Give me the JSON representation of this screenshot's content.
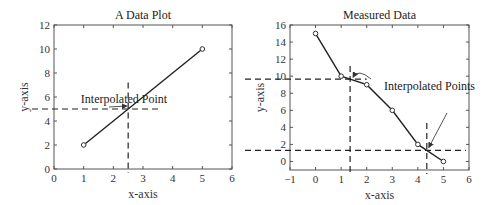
{
  "chart_data": [
    {
      "type": "line",
      "title": "A Data Plot",
      "xlabel": "x-axis",
      "ylabel": "y-axis",
      "xlim": [
        0,
        6
      ],
      "ylim": [
        0,
        12
      ],
      "xticks": [
        0,
        1,
        2,
        3,
        4,
        5,
        6
      ],
      "yticks": [
        0,
        2,
        4,
        6,
        8,
        10,
        12
      ],
      "grid": false,
      "series": [
        {
          "name": "data",
          "x": [
            1,
            5
          ],
          "y": [
            2,
            10
          ],
          "marker": "o"
        }
      ],
      "interpolated_points": [
        {
          "x": 2.5,
          "y": 5
        }
      ],
      "annotations": [
        {
          "text": "Interpolated Point",
          "target": [
            2.5,
            5
          ]
        }
      ]
    },
    {
      "type": "line",
      "title": "Measured Data",
      "xlabel": "x-axis",
      "ylabel": "y-axis",
      "xlim": [
        -1,
        6
      ],
      "ylim": [
        -1,
        16
      ],
      "xticks": [
        -1,
        0,
        1,
        2,
        3,
        4,
        5,
        6
      ],
      "yticks": [
        0,
        2,
        4,
        6,
        8,
        10,
        12,
        14,
        16
      ],
      "grid": false,
      "series": [
        {
          "name": "data",
          "x": [
            0,
            1,
            2,
            3,
            4,
            5
          ],
          "y": [
            15,
            10,
            9,
            6,
            2,
            0
          ],
          "marker": "o"
        }
      ],
      "interpolated_points": [
        {
          "x": 1.35,
          "y": 9.65
        },
        {
          "x": 4.35,
          "y": 1.3
        }
      ],
      "annotations": [
        {
          "text": "Interpolated Points",
          "targets": [
            [
              1.35,
              9.65
            ],
            [
              4.35,
              1.3
            ]
          ]
        }
      ]
    }
  ]
}
